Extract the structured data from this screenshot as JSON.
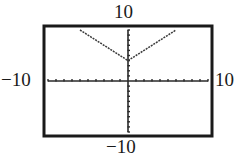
{
  "chart_data": {
    "type": "line",
    "title": "",
    "function": "y = |x| + 4",
    "xlabel": "",
    "ylabel": "",
    "xlim": [
      -10,
      10
    ],
    "ylim": [
      -10,
      10
    ],
    "xscl": 1,
    "yscl": 1,
    "grid": false,
    "legend": null,
    "series": [
      {
        "name": "y = |x| + 4",
        "x": [
          -6,
          -5,
          -4,
          -3,
          -2,
          -1,
          0,
          1,
          2,
          3,
          4,
          5,
          6
        ],
        "y": [
          10,
          9,
          8,
          7,
          6,
          5,
          4,
          5,
          6,
          7,
          8,
          9,
          10
        ]
      }
    ],
    "window_labels": {
      "ymax": "10",
      "ymin": "−10",
      "xmin": "−10",
      "xmax": "10"
    }
  },
  "colors": {
    "frame": "#1a1a1a",
    "axes": "#2a2a2a",
    "curve": "#3a3a3a",
    "background": "#ffffff"
  }
}
